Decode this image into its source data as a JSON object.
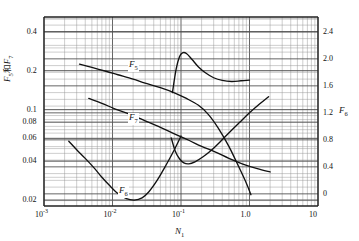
{
  "chart_data": {
    "type": "line",
    "title": "",
    "xlabel": "N₁",
    "ylabel_left": "F₅和F₇",
    "ylabel_right": "F₆",
    "xscale": "log",
    "yscale_left": "log",
    "yscale_right": "linear",
    "xlim": [
      0.001,
      10
    ],
    "ylim_left": [
      0.018,
      0.52
    ],
    "ylim_right": [
      -0.18,
      2.62
    ],
    "grid": true,
    "grid_minor": true,
    "legend_position": "inline-curve-labels",
    "xticks": [
      "10⁻³",
      "10⁻²",
      "10⁻¹",
      "1.0",
      "10"
    ],
    "xtick_values": [
      0.001,
      0.01,
      0.1,
      1.0,
      10
    ],
    "yticks_left": [
      "0.02",
      "0.04",
      "0.06",
      "0.08",
      "0.1",
      "0.2",
      "0.4"
    ],
    "ytick_values_left": [
      0.02,
      0.04,
      0.06,
      0.08,
      0.1,
      0.2,
      0.4
    ],
    "yticks_right": [
      "0",
      "0.4",
      "0.8",
      "1.2",
      "1.6",
      "2.0",
      "2.4"
    ],
    "ytick_values_right": [
      0,
      0.4,
      0.8,
      1.2,
      1.6,
      2.0,
      2.4
    ],
    "series": [
      {
        "name": "F₅",
        "axis": "left",
        "label": "F₅",
        "points": [
          [
            0.0033,
            0.225
          ],
          [
            0.005,
            0.212
          ],
          [
            0.008,
            0.198
          ],
          [
            0.012,
            0.186
          ],
          [
            0.02,
            0.172
          ],
          [
            0.03,
            0.16
          ],
          [
            0.05,
            0.148
          ],
          [
            0.08,
            0.135
          ],
          [
            0.12,
            0.122
          ],
          [
            0.18,
            0.108
          ],
          [
            0.25,
            0.092
          ],
          [
            0.35,
            0.072
          ],
          [
            0.5,
            0.052
          ],
          [
            0.7,
            0.036
          ],
          [
            0.9,
            0.027
          ],
          [
            1.05,
            0.022
          ]
        ]
      },
      {
        "name": "F₇",
        "axis": "left",
        "label": "F₇",
        "points": [
          [
            0.0045,
            0.122
          ],
          [
            0.007,
            0.112
          ],
          [
            0.011,
            0.101
          ],
          [
            0.018,
            0.092
          ],
          [
            0.03,
            0.082
          ],
          [
            0.05,
            0.073
          ],
          [
            0.08,
            0.065
          ],
          [
            0.13,
            0.058
          ],
          [
            0.2,
            0.052
          ],
          [
            0.32,
            0.047
          ],
          [
            0.5,
            0.042
          ],
          [
            0.8,
            0.038
          ],
          [
            1.3,
            0.035
          ],
          [
            2.0,
            0.033
          ]
        ]
      },
      {
        "name": "F₆-low",
        "axis": "left",
        "label": "F₆",
        "points": [
          [
            0.0023,
            0.057
          ],
          [
            0.003,
            0.049
          ],
          [
            0.004,
            0.042
          ],
          [
            0.0055,
            0.035
          ],
          [
            0.007,
            0.03
          ],
          [
            0.009,
            0.026
          ],
          [
            0.012,
            0.0225
          ],
          [
            0.016,
            0.0205
          ],
          [
            0.021,
            0.02
          ],
          [
            0.027,
            0.0208
          ],
          [
            0.034,
            0.0232
          ],
          [
            0.045,
            0.0285
          ],
          [
            0.06,
            0.037
          ],
          [
            0.08,
            0.049
          ],
          [
            0.1,
            0.0625
          ]
        ]
      },
      {
        "name": "F₆-peak",
        "axis": "right",
        "label": "",
        "points": [
          [
            0.075,
            1.5
          ],
          [
            0.085,
            1.85
          ],
          [
            0.095,
            2.03
          ],
          [
            0.105,
            2.09
          ],
          [
            0.12,
            2.08
          ],
          [
            0.145,
            1.99
          ],
          [
            0.18,
            1.88
          ],
          [
            0.23,
            1.79
          ],
          [
            0.3,
            1.72
          ],
          [
            0.4,
            1.68
          ],
          [
            0.55,
            1.665
          ],
          [
            0.75,
            1.675
          ],
          [
            1.0,
            1.685
          ]
        ]
      },
      {
        "name": "F₆-valley",
        "axis": "right",
        "label": "",
        "points": [
          [
            0.072,
            0.83
          ],
          [
            0.082,
            0.64
          ],
          [
            0.095,
            0.52
          ],
          [
            0.11,
            0.46
          ],
          [
            0.13,
            0.445
          ],
          [
            0.16,
            0.475
          ],
          [
            0.21,
            0.55
          ],
          [
            0.28,
            0.65
          ],
          [
            0.38,
            0.78
          ],
          [
            0.52,
            0.92
          ],
          [
            0.72,
            1.06
          ],
          [
            1.0,
            1.2
          ],
          [
            1.4,
            1.33
          ],
          [
            1.9,
            1.44
          ]
        ]
      }
    ]
  },
  "curve_labels": [
    {
      "id": "f5",
      "text": "F",
      "sub": "5"
    },
    {
      "id": "f7",
      "text": "F",
      "sub": "7"
    },
    {
      "id": "f6",
      "text": "F",
      "sub": "6"
    }
  ],
  "axes": {
    "x_label_main": "N",
    "x_label_sub": "1",
    "y_left_f5": "F",
    "y_left_f5_sub": "5",
    "y_left_conj": "和",
    "y_left_f7": "F",
    "y_left_f7_sub": "7",
    "y_right_main": "F",
    "y_right_sub": "6"
  },
  "colors": {
    "curve": "#111111",
    "grid_major": "#4a4a4a",
    "grid_minor": "#8f8f8f",
    "frame": "#222222",
    "background": "#ffffff",
    "text": "#111111"
  }
}
